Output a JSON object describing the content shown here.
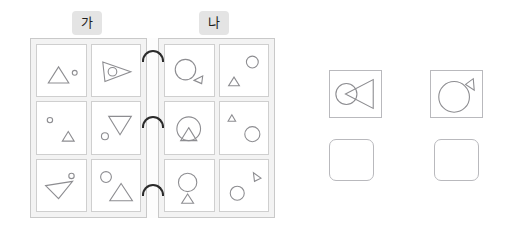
{
  "worksheet": {
    "left_page": {
      "label": "가",
      "cells": [
        {
          "name": "cell-ga-1",
          "description": "large triangle left, small circle right",
          "shapes": [
            {
              "type": "triangle",
              "cx": 40,
              "cy": 46,
              "w": 38,
              "h": 30,
              "dir": "up"
            },
            {
              "type": "circle",
              "cx": 70,
              "cy": 42,
              "r": 4.5
            }
          ]
        },
        {
          "name": "cell-ga-2",
          "description": "tilted right-pointing triangle with circle inside",
          "shapes": [
            {
              "type": "polygon",
              "points": "20,22 72,40 24,58"
            },
            {
              "type": "circle",
              "cx": 38,
              "cy": 40,
              "r": 8
            }
          ]
        },
        {
          "name": "cell-ga-3",
          "description": "small circle upper-left, small triangle lower-right",
          "shapes": [
            {
              "type": "circle",
              "cx": 24,
              "cy": 24,
              "r": 5
            },
            {
              "type": "triangle",
              "cx": 58,
              "cy": 54,
              "w": 22,
              "h": 18,
              "dir": "up"
            }
          ]
        },
        {
          "name": "cell-ga-4",
          "description": "large inverted triangle, small circle lower-left",
          "shapes": [
            {
              "type": "triangle",
              "cx": 52,
              "cy": 34,
              "w": 42,
              "h": 34,
              "dir": "down"
            },
            {
              "type": "circle",
              "cx": 24,
              "cy": 54,
              "r": 6.5
            }
          ]
        },
        {
          "name": "cell-ga-5",
          "description": "left-pointing tilted triangle, small circle upper-right",
          "shapes": [
            {
              "type": "polygon",
              "points": "16,38 66,30 40,62"
            },
            {
              "type": "circle",
              "cx": 64,
              "cy": 20,
              "r": 5
            }
          ]
        },
        {
          "name": "cell-ga-6",
          "description": "circle upper-left, large triangle below-right",
          "shapes": [
            {
              "type": "circle",
              "cx": 26,
              "cy": 22,
              "r": 10
            },
            {
              "type": "triangle",
              "cx": 54,
              "cy": 50,
              "w": 42,
              "h": 32,
              "dir": "up"
            }
          ]
        }
      ]
    },
    "right_page": {
      "label": "나",
      "cells": [
        {
          "name": "cell-na-1",
          "description": "large circle, small right-pointing triangle lower-right",
          "shapes": [
            {
              "type": "circle",
              "cx": 38,
              "cy": 36,
              "r": 19
            },
            {
              "type": "polygon",
              "points": "54,56 70,48 68,62"
            }
          ]
        },
        {
          "name": "cell-na-2",
          "description": "circle upper-right, small triangle lower-left",
          "shapes": [
            {
              "type": "circle",
              "cx": 60,
              "cy": 22,
              "r": 11
            },
            {
              "type": "triangle",
              "cx": 26,
              "cy": 58,
              "w": 20,
              "h": 16,
              "dir": "up"
            }
          ]
        },
        {
          "name": "cell-na-3",
          "description": "large circle with triangle inside",
          "shapes": [
            {
              "type": "circle",
              "cx": 44,
              "cy": 40,
              "r": 22
            },
            {
              "type": "triangle",
              "cx": 44,
              "cy": 50,
              "w": 30,
              "h": 24,
              "dir": "up"
            }
          ]
        },
        {
          "name": "cell-na-4",
          "description": "tiny triangle upper-left, circle lower-right",
          "shapes": [
            {
              "type": "triangle",
              "cx": 22,
              "cy": 20,
              "w": 14,
              "h": 12,
              "dir": "up"
            },
            {
              "type": "circle",
              "cx": 60,
              "cy": 50,
              "r": 14
            }
          ]
        },
        {
          "name": "cell-na-5",
          "description": "circle on top of a triangle (balloon)",
          "shapes": [
            {
              "type": "circle",
              "cx": 42,
              "cy": 32,
              "r": 17
            },
            {
              "type": "triangle",
              "cx": 42,
              "cy": 62,
              "w": 22,
              "h": 17,
              "dir": "up"
            }
          ]
        },
        {
          "name": "cell-na-6",
          "description": "small tilted triangle upper-right, circle lower-left",
          "shapes": [
            {
              "type": "polygon",
              "points": "62,14 76,24 64,30"
            },
            {
              "type": "circle",
              "cx": 32,
              "cy": 52,
              "r": 13
            }
          ]
        }
      ]
    },
    "answers": [
      {
        "name": "answer-1",
        "figure_description": "circle overlapped by a large left-pointing triangle",
        "shapes": [
          {
            "type": "circle",
            "cx": 17,
            "cy": 24,
            "r": 11
          },
          {
            "type": "polygon",
            "points": "16,24 45,9 45,39"
          }
        ],
        "blank_label": ""
      },
      {
        "name": "answer-2",
        "figure_description": "large circle with small triangle at upper right",
        "shapes": [
          {
            "type": "circle",
            "cx": 24,
            "cy": 27,
            "r": 16
          },
          {
            "type": "polygon",
            "points": "36,14 44,8 45,20"
          }
        ],
        "blank_label": ""
      }
    ]
  },
  "colors": {
    "page_background": "#f3f3f3",
    "page_border": "#c9c9c9",
    "cell_border": "#cfcfcf",
    "shape_stroke": "#8d8d91",
    "tag_background": "#e4e4e4",
    "ring_color": "#2b2b2b",
    "answer_border": "#b9b9bd"
  }
}
